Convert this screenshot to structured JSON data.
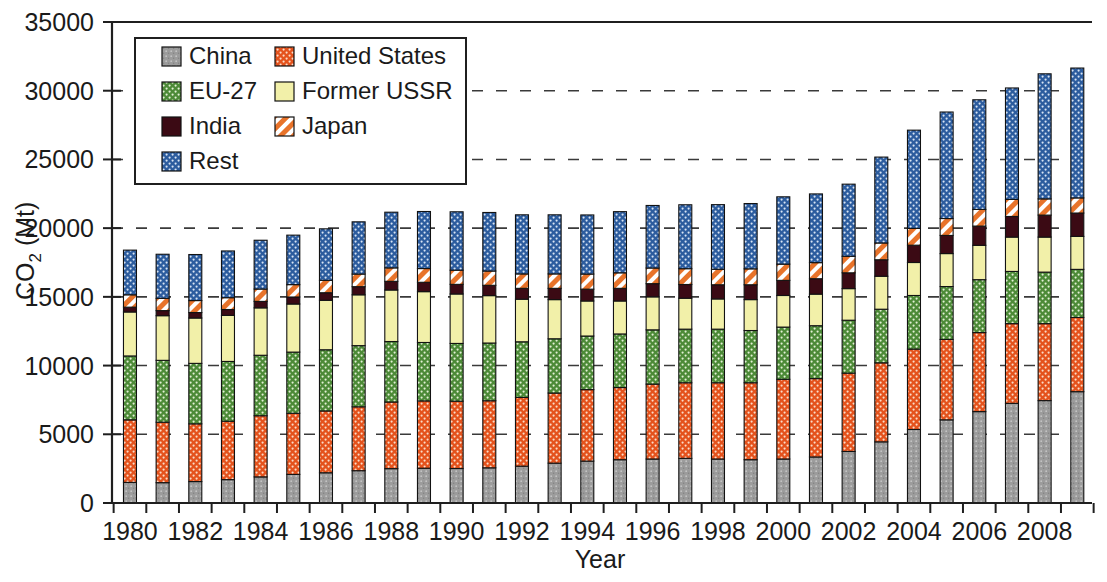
{
  "chart_data": {
    "type": "bar",
    "stacked": true,
    "title": "",
    "xlabel": "Year",
    "ylabel": "CO2 (Mt)",
    "ylabel_base": "CO",
    "ylabel_sub": "2",
    "ylabel_unit": " (Mt)",
    "ylim": [
      0,
      35000
    ],
    "ytick_step": 5000,
    "yticks": [
      "0",
      "5000",
      "10000",
      "15000",
      "20000",
      "25000",
      "30000",
      "35000"
    ],
    "ytick_values": [
      0,
      5000,
      10000,
      15000,
      20000,
      25000,
      30000,
      35000
    ],
    "grid": "horizontal-dashed",
    "legend_position": "top-left-inside",
    "x": [
      1980,
      1981,
      1982,
      1983,
      1984,
      1985,
      1986,
      1987,
      1988,
      1989,
      1990,
      1991,
      1992,
      1993,
      1994,
      1995,
      1996,
      1997,
      1998,
      1999,
      2000,
      2001,
      2002,
      2003,
      2004,
      2005,
      2006,
      2007,
      2008,
      2009
    ],
    "xtick_labels": [
      "1980",
      "",
      "1982",
      "",
      "1984",
      "",
      "1986",
      "",
      "1988",
      "",
      "1990",
      "",
      "1992",
      "",
      "1994",
      "",
      "1996",
      "",
      "1998",
      "",
      "2000",
      "",
      "2002",
      "",
      "2004",
      "",
      "2006",
      "",
      "2008",
      ""
    ],
    "series": [
      {
        "name": "China",
        "color": "#9c9c9c",
        "pattern": "speckle",
        "values": [
          1500,
          1480,
          1560,
          1700,
          1900,
          2080,
          2200,
          2350,
          2500,
          2530,
          2510,
          2560,
          2680,
          2900,
          3050,
          3150,
          3200,
          3250,
          3200,
          3150,
          3200,
          3350,
          3750,
          4450,
          5350,
          6050,
          6650,
          7250,
          7450,
          8100
        ]
      },
      {
        "name": "United States",
        "color": "#e4521c",
        "pattern": "dots",
        "values": [
          4550,
          4400,
          4200,
          4250,
          4450,
          4450,
          4500,
          4650,
          4850,
          4900,
          4900,
          4880,
          5000,
          5100,
          5200,
          5250,
          5450,
          5500,
          5550,
          5600,
          5800,
          5700,
          5700,
          5750,
          5850,
          5850,
          5750,
          5800,
          5600,
          5400
        ]
      },
      {
        "name": "EU-27",
        "color": "#4c8a37",
        "pattern": "dots",
        "values": [
          4650,
          4500,
          4400,
          4350,
          4400,
          4450,
          4450,
          4450,
          4400,
          4250,
          4200,
          4200,
          4050,
          3950,
          3900,
          3900,
          3950,
          3900,
          3900,
          3800,
          3800,
          3850,
          3850,
          3900,
          3900,
          3850,
          3850,
          3800,
          3750,
          3500
        ]
      },
      {
        "name": "Former USSR",
        "color": "#f2f0a9",
        "pattern": "solid",
        "values": [
          3200,
          3250,
          3300,
          3350,
          3450,
          3500,
          3600,
          3700,
          3750,
          3700,
          3600,
          3450,
          3100,
          2850,
          2550,
          2400,
          2400,
          2250,
          2200,
          2250,
          2300,
          2300,
          2300,
          2400,
          2400,
          2400,
          2500,
          2500,
          2550,
          2400
        ]
      },
      {
        "name": "India",
        "color": "#3b0a14",
        "pattern": "solid",
        "values": [
          350,
          370,
          400,
          430,
          470,
          510,
          550,
          590,
          630,
          680,
          700,
          750,
          790,
          820,
          860,
          920,
          960,
          1000,
          1030,
          1080,
          1100,
          1120,
          1150,
          1200,
          1260,
          1320,
          1400,
          1500,
          1600,
          1700
        ]
      },
      {
        "name": "Japan",
        "color": "#e8732a",
        "pattern": "stripes",
        "values": [
          900,
          890,
          870,
          860,
          900,
          900,
          900,
          920,
          980,
          1000,
          1030,
          1040,
          1050,
          1050,
          1100,
          1130,
          1140,
          1150,
          1130,
          1160,
          1180,
          1170,
          1200,
          1220,
          1220,
          1230,
          1210,
          1240,
          1180,
          1100
        ]
      },
      {
        "name": "Rest",
        "color": "#2c5c9e",
        "pattern": "dots",
        "values": [
          3250,
          3210,
          3350,
          3400,
          3550,
          3600,
          3750,
          3800,
          4050,
          4150,
          4250,
          4260,
          4300,
          4300,
          4300,
          4450,
          4550,
          4650,
          4700,
          4750,
          4900,
          5000,
          5250,
          6250,
          7150,
          7750,
          7980,
          8110,
          9100,
          9450
        ]
      }
    ],
    "legend": [
      {
        "label": "China",
        "color": "#9c9c9c",
        "pattern": "speckle"
      },
      {
        "label": "United States",
        "color": "#e4521c",
        "pattern": "dots"
      },
      {
        "label": "EU-27",
        "color": "#4c8a37",
        "pattern": "dots"
      },
      {
        "label": "Former USSR",
        "color": "#f2f0a9",
        "pattern": "solid"
      },
      {
        "label": "India",
        "color": "#3b0a14",
        "pattern": "solid"
      },
      {
        "label": "Japan",
        "color": "#e8732a",
        "pattern": "stripes"
      },
      {
        "label": "Rest",
        "color": "#2c5c9e",
        "pattern": "dots"
      }
    ]
  }
}
